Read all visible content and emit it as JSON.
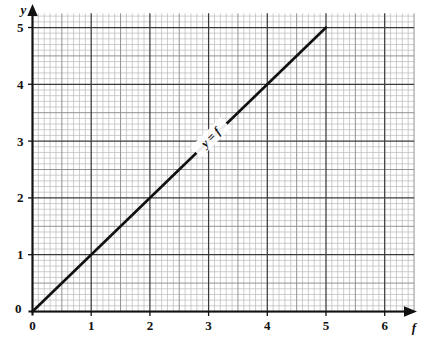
{
  "figure": {
    "background_color": "#ffffff",
    "ink_color": "#111111",
    "grid_minor_color": "#b9b9b9",
    "grid_half_color": "#8d8d8d",
    "grid_major_color": "#3a3a3a"
  },
  "chart_data": {
    "type": "line",
    "title": "",
    "xlabel": "f",
    "ylabel": "y",
    "xlim": [
      0,
      6.5
    ],
    "ylim": [
      0,
      5.25
    ],
    "grid": true,
    "grid_minor_step": 0.1,
    "grid_half_step": 0.5,
    "grid_major_step": 1,
    "legend": "none",
    "x_tick_labels": [
      "0",
      "1",
      "2",
      "3",
      "4",
      "5",
      "6"
    ],
    "x_tick_values": [
      0,
      1,
      2,
      3,
      4,
      5,
      6
    ],
    "y_tick_labels": [
      "0",
      "1",
      "2",
      "3",
      "4",
      "5"
    ],
    "y_tick_values": [
      0,
      1,
      2,
      3,
      4,
      5
    ],
    "series": [
      {
        "name": "y = f",
        "equation": "y = f",
        "slope": 1,
        "intercept": 0,
        "x": [
          0,
          5
        ],
        "values": [
          0,
          5
        ],
        "color": "#111111",
        "line_width": 2.6,
        "annotation": {
          "text": "y = f",
          "at_x": 3.05,
          "at_y": 3.05,
          "rotation_deg": -45
        }
      }
    ]
  },
  "axes": {
    "y_axis_label": "y",
    "x_axis_label": "f",
    "y_origin_label": "0",
    "x_origin_label": "0",
    "arrowheads": true
  }
}
